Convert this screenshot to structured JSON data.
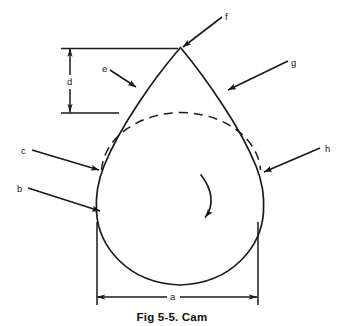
{
  "figure": {
    "caption": "Fig 5-5.  Cam",
    "line_color": "#1a1a1a",
    "background_color": "#ffffff"
  },
  "callouts": [
    {
      "id": "b",
      "label": "b",
      "x": 17,
      "y": 184,
      "target": "cam-profile-lower-left"
    },
    {
      "id": "c",
      "label": "c",
      "x": 21,
      "y": 146,
      "target": "cam-profile-flank-left"
    },
    {
      "id": "e",
      "label": "e",
      "x": 102,
      "y": 64,
      "target": "cam-profile-rise-left"
    },
    {
      "id": "f",
      "label": "f",
      "x": 225,
      "y": 12,
      "target": "cam-nose-apex"
    },
    {
      "id": "g",
      "label": "g",
      "x": 291,
      "y": 58,
      "target": "cam-profile-rise-right"
    },
    {
      "id": "h",
      "label": "h",
      "x": 325,
      "y": 144,
      "target": "cam-profile-flank-right"
    }
  ],
  "dimensions": [
    {
      "id": "a",
      "label": "a",
      "orientation": "horizontal",
      "x": 173,
      "y": 292
    },
    {
      "id": "d",
      "label": "d",
      "orientation": "vertical",
      "x": 70,
      "y": 82
    }
  ],
  "rotation": {
    "direction": "clockwise",
    "indicator": "curved-arrow"
  }
}
